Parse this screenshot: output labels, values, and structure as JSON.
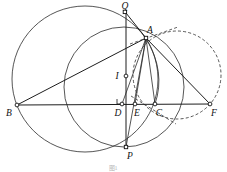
{
  "figure": {
    "caption": "图1",
    "canvas": {
      "width": 227,
      "height": 172
    },
    "points": [
      {
        "id": "Q",
        "label": "Q",
        "x": 126,
        "y": 13,
        "label_dx": -1,
        "label_dy": -4,
        "marker": "square"
      },
      {
        "id": "A",
        "label": "A",
        "x": 146,
        "y": 38,
        "label_dx": 2,
        "label_dy": -5,
        "marker": "square"
      },
      {
        "id": "I",
        "label": "I",
        "x": 126,
        "y": 76,
        "label_dx": -10,
        "label_dy": 2,
        "marker": "circle"
      },
      {
        "id": "B",
        "label": "B",
        "x": 17,
        "y": 105,
        "label_dx": -9,
        "label_dy": 10,
        "marker": "circle"
      },
      {
        "id": "D",
        "label": "D",
        "x": 122,
        "y": 104,
        "label_dx": -6,
        "label_dy": 11,
        "marker": "circle"
      },
      {
        "id": "E",
        "label": "E",
        "x": 135,
        "y": 104,
        "label_dx": 0,
        "label_dy": 11,
        "marker": "circle"
      },
      {
        "id": "C",
        "label": "C",
        "x": 155,
        "y": 104,
        "label_dx": 1,
        "label_dy": 11,
        "marker": "circle"
      },
      {
        "id": "F",
        "label": "F",
        "x": 210,
        "y": 104,
        "label_dx": 2,
        "label_dy": 11,
        "marker": "circle"
      },
      {
        "id": "P",
        "label": "P",
        "x": 126,
        "y": 147,
        "label_dx": 2,
        "label_dy": 10,
        "marker": "square"
      }
    ],
    "circles": [
      {
        "id": "circumcircle-ABС",
        "name": "big-circle",
        "cx": 85,
        "cy": 79,
        "r": 73,
        "style": "solid"
      },
      {
        "id": "circle-ADCP",
        "name": "medium-circle",
        "cx": 124,
        "cy": 87,
        "r": 60,
        "style": "solid"
      },
      {
        "id": "circle-right",
        "name": "dashed-circle",
        "cx": 177,
        "cy": 75,
        "r": 44,
        "style": "dashed"
      }
    ],
    "arcs": [
      {
        "id": "arc-A-C",
        "name": "arc-through-A-and-C",
        "from": "A",
        "to": "C",
        "style": "solid"
      }
    ],
    "segments": [
      {
        "id": "BF",
        "name": "baseline-B-F",
        "from": "B",
        "to": "F",
        "style": "solid"
      },
      {
        "id": "BA",
        "name": "segment-B-A",
        "from": "B",
        "to": "A",
        "style": "solid"
      },
      {
        "id": "QA",
        "name": "segment-Q-A",
        "from": "Q",
        "to": "A",
        "style": "solid"
      },
      {
        "id": "QP",
        "name": "segment-Q-P",
        "from": "Q",
        "to": "P",
        "style": "solid"
      },
      {
        "id": "AD",
        "name": "segment-A-D",
        "from": "A",
        "to": "D",
        "style": "solid"
      },
      {
        "id": "AE",
        "name": "segment-A-E",
        "from": "A",
        "to": "E",
        "style": "solid"
      },
      {
        "id": "AC",
        "name": "segment-A-C",
        "from": "A",
        "to": "C",
        "style": "solid"
      },
      {
        "id": "AP",
        "name": "segment-A-P",
        "from": "A",
        "to": "P",
        "style": "solid"
      },
      {
        "id": "AF",
        "name": "segment-A-F",
        "from": "A",
        "to": "F",
        "style": "solid"
      }
    ],
    "dashed_segments": [
      {
        "id": "tangent-A",
        "name": "tangent-line-at-A",
        "x1": 130,
        "y1": 44,
        "x2": 178,
        "y2": 27
      },
      {
        "id": "EG",
        "name": "dashed-ray-from-E",
        "x1": 131,
        "y1": 96,
        "x2": 176,
        "y2": 124
      }
    ],
    "right_angle": {
      "id": "right-angle-D",
      "name": "right-angle-marker-at-D",
      "x": 122,
      "y": 104,
      "size": 5
    }
  }
}
